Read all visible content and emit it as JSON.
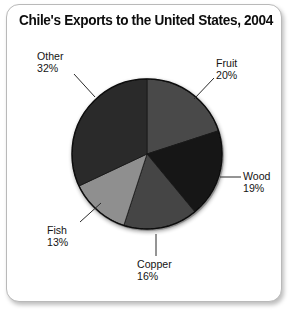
{
  "title": "Chile's Exports to the United States, 2004",
  "chart_data": {
    "type": "pie",
    "title": "Chile's Exports to the United States, 2004",
    "xlabel": "",
    "ylabel": "",
    "value_unit": "percent",
    "start_angle_deg": 0,
    "direction": "clockwise",
    "legend": "none",
    "grid": false,
    "categories": [
      "Fruit",
      "Wood",
      "Copper",
      "Fish",
      "Other"
    ],
    "values": [
      20,
      19,
      16,
      13,
      32
    ],
    "slices": [
      {
        "label": "Fruit",
        "value": 20,
        "value_text": "20%",
        "color": "#4a4a4a"
      },
      {
        "label": "Wood",
        "value": 19,
        "value_text": "19%",
        "color": "#191919"
      },
      {
        "label": "Copper",
        "value": 16,
        "value_text": "16%",
        "color": "#444444"
      },
      {
        "label": "Fish",
        "value": 13,
        "value_text": "13%",
        "color": "#8f8f8f"
      },
      {
        "label": "Other",
        "value": 32,
        "value_text": "32%",
        "color": "#2b2b2b"
      }
    ],
    "total": 100
  },
  "labels": {
    "fruit": {
      "name": "Fruit",
      "pct": "20%"
    },
    "wood": {
      "name": "Wood",
      "pct": "19%"
    },
    "copper": {
      "name": "Copper",
      "pct": "16%"
    },
    "fish": {
      "name": "Fish",
      "pct": "13%"
    },
    "other": {
      "name": "Other",
      "pct": "32%"
    }
  },
  "colors": {
    "fruit": "#4a4a4a",
    "wood": "#191919",
    "copper": "#444444",
    "fish": "#8f8f8f",
    "other": "#2b2b2b",
    "rim": "#101010",
    "frame_border": "#b9b9b9",
    "background": "#ffffff",
    "text": "#141414"
  }
}
